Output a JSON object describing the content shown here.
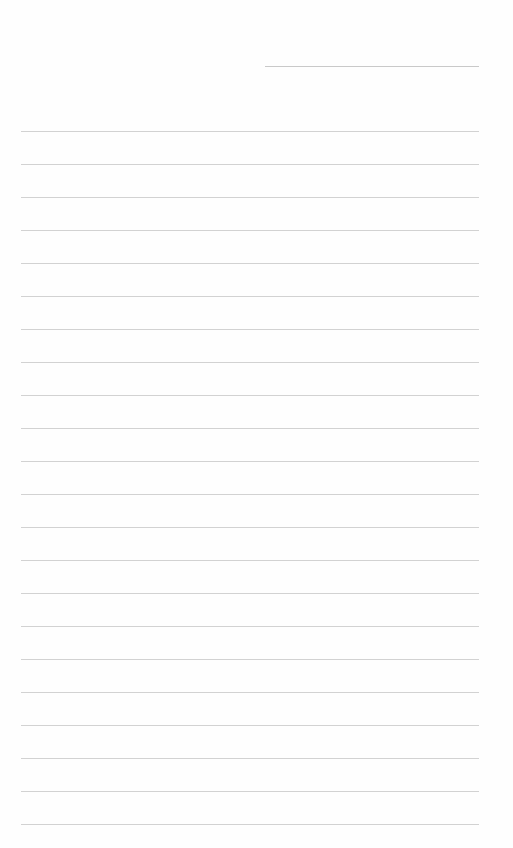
{
  "page": {
    "type": "lined-paper",
    "background": "#fefefe",
    "line_color": "#d2d2d2",
    "header_line": {
      "x1": 265,
      "x2": 479,
      "y": 66,
      "color": "#c9c9c9"
    },
    "ruled_lines": {
      "x1": 21,
      "x2": 479,
      "start_y": 131,
      "spacing": 33,
      "count": 22
    }
  }
}
